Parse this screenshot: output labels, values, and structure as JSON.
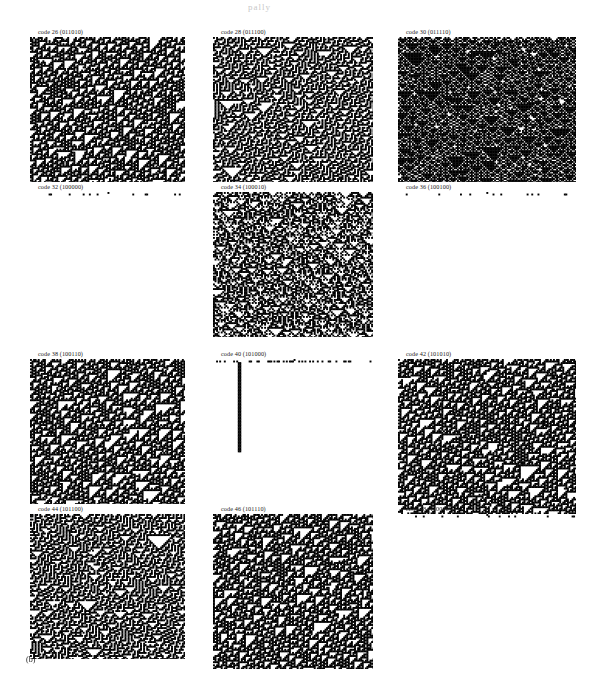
{
  "figure": {
    "label": "(b)",
    "top_artifact": "pally",
    "background_color": "#ffffff",
    "cell_color": "#000000",
    "columns": 3,
    "rows": 4
  },
  "panels": [
    {
      "caption": "code 26 (011010)",
      "code": 26,
      "binary": "011010",
      "row": 0,
      "col": 0,
      "x": 30,
      "y": 10,
      "width": 155,
      "height": 145,
      "pattern": "chaotic-dense",
      "density": 0.52,
      "seed": 26,
      "class_label": "chaotic"
    },
    {
      "caption": "code 28 (011100)",
      "code": 28,
      "binary": "011100",
      "row": 0,
      "col": 1,
      "x": 213,
      "y": 10,
      "width": 160,
      "height": 145,
      "pattern": "triangles",
      "density": 0.46,
      "seed": 28,
      "class_label": "nested-triangles"
    },
    {
      "caption": "code 30 (011110)",
      "code": 30,
      "binary": "011110",
      "row": 0,
      "col": 2,
      "x": 398,
      "y": 10,
      "width": 178,
      "height": 145,
      "pattern": "banded",
      "density": 0.4,
      "seed": 30,
      "class_label": "banded"
    },
    {
      "caption": "code 32 (100000)",
      "code": 32,
      "binary": "100000",
      "row": 1,
      "col": 0,
      "x": 30,
      "y": 165,
      "width": 155,
      "height": 145,
      "pattern": "extinct",
      "density": 0.02,
      "seed": 32,
      "class_label": "dies-out"
    },
    {
      "caption": "code 34 (100010)",
      "code": 34,
      "binary": "100010",
      "row": 1,
      "col": 1,
      "x": 213,
      "y": 165,
      "width": 160,
      "height": 145,
      "pattern": "sparse-chaotic",
      "density": 0.38,
      "seed": 34,
      "class_label": "chaotic"
    },
    {
      "caption": "code 36 (100100)",
      "code": 36,
      "binary": "100100",
      "row": 1,
      "col": 2,
      "x": 398,
      "y": 165,
      "width": 178,
      "height": 145,
      "pattern": "extinct",
      "density": 0.03,
      "seed": 36,
      "class_label": "dies-out"
    },
    {
      "caption": "code 38 (100110)",
      "code": 38,
      "binary": "100110",
      "row": 2,
      "col": 0,
      "x": 30,
      "y": 332,
      "width": 155,
      "height": 145,
      "pattern": "chaotic-dense",
      "density": 0.5,
      "seed": 38,
      "class_label": "chaotic"
    },
    {
      "caption": "code 40 (101000)",
      "code": 40,
      "binary": "101000",
      "row": 2,
      "col": 1,
      "x": 213,
      "y": 332,
      "width": 160,
      "height": 145,
      "pattern": "single-column",
      "density": 0.03,
      "seed": 40,
      "class_label": "dies-out-with-stem"
    },
    {
      "caption": "code 42 (101010)",
      "code": 42,
      "binary": "101010",
      "row": 2,
      "col": 2,
      "x": 398,
      "y": 332,
      "width": 178,
      "height": 155,
      "pattern": "chaotic-dense",
      "density": 0.54,
      "seed": 42,
      "class_label": "chaotic"
    },
    {
      "caption": "code 44 (101100)",
      "code": 44,
      "binary": "101100",
      "row": 3,
      "col": 0,
      "x": 30,
      "y": 487,
      "width": 155,
      "height": 145,
      "pattern": "triangles",
      "density": 0.5,
      "seed": 44,
      "class_label": "nested-triangles"
    },
    {
      "caption": "code 46 (101110)",
      "code": 46,
      "binary": "101110",
      "row": 3,
      "col": 1,
      "x": 213,
      "y": 487,
      "width": 160,
      "height": 155,
      "pattern": "chaotic-dense",
      "density": 0.56,
      "seed": 46,
      "class_label": "chaotic"
    },
    {
      "caption": "code 48 (110000)",
      "code": 48,
      "binary": "110000",
      "row": 3,
      "col": 2,
      "x": 398,
      "y": 487,
      "width": 178,
      "height": 145,
      "pattern": "extinct",
      "density": 0.02,
      "seed": 48,
      "class_label": "dies-out"
    }
  ]
}
